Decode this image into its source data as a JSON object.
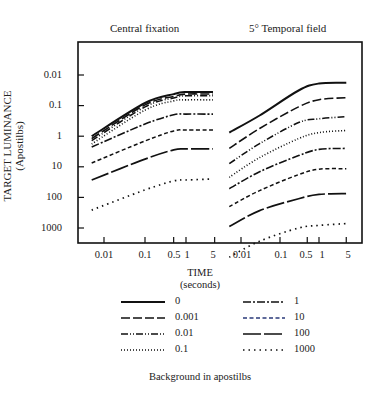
{
  "chart_data": {
    "type": "line",
    "title": "",
    "panels": [
      {
        "title": "Central fixation",
        "x": [
          0.005,
          0.1,
          0.5,
          1,
          5
        ],
        "series": [
          {
            "name": "0",
            "values": [
              1.0,
              0.082,
              0.042,
              0.036,
              0.036
            ]
          },
          {
            "name": "0.001",
            "values": [
              1.2,
              0.095,
              0.05,
              0.042,
              0.042
            ]
          },
          {
            "name": "0.01",
            "values": [
              1.4,
              0.11,
              0.056,
              0.048,
              0.048
            ]
          },
          {
            "name": "0.1",
            "values": [
              1.8,
              0.14,
              0.07,
              0.065,
              0.065
            ]
          },
          {
            "name": "1",
            "values": [
              2.25,
              0.4,
              0.2,
              0.19,
              0.19
            ]
          },
          {
            "name": "10",
            "values": [
              7.5,
              1.43,
              0.67,
              0.63,
              0.63
            ]
          },
          {
            "name": "100",
            "values": [
              27,
              5.6,
              2.8,
              2.6,
              2.6
            ]
          },
          {
            "name": "1000",
            "values": [
              260,
              57,
              29,
              27,
              25
            ]
          }
        ]
      },
      {
        "title": "5° Temporal field",
        "x": [
          0.005,
          0.03,
          0.3,
          1,
          5
        ],
        "series": [
          {
            "name": "0",
            "values": [
              0.76,
              0.21,
              0.032,
              0.019,
              0.018
            ]
          },
          {
            "name": "0.001",
            "values": [
              2.5,
              0.56,
              0.11,
              0.064,
              0.055
            ]
          },
          {
            "name": "0.01",
            "values": [
              7.9,
              1.75,
              0.36,
              0.27,
              0.23
            ]
          },
          {
            "name": "0.1",
            "values": [
              22,
              5.0,
              1.2,
              0.76,
              0.65
            ]
          },
          {
            "name": "1",
            "values": [
              52,
              14.5,
              4.3,
              2.7,
              2.5
            ]
          },
          {
            "name": "10",
            "values": [
              200,
              60,
              18,
              12,
              11.5
            ]
          },
          {
            "name": "100",
            "values": [
              900,
              270,
              110,
              80,
              75
            ]
          },
          {
            "name": "1000",
            "values": [
              9000,
              2700,
              1000,
              820,
              720
            ]
          }
        ]
      }
    ],
    "xlabel": "TIME (seconds)",
    "ylabel": "TARGET LUMINANCE (Apostilbs)",
    "x_ticks": [
      "0.01",
      "0.1",
      "0.5",
      "1",
      "5"
    ],
    "y_ticks": [
      "0.01",
      "0.1",
      "1",
      "10",
      "100",
      "1000"
    ],
    "y_scale": "log, inverted (0.01 at top, 1000 at bottom)",
    "x_scale": "log",
    "legend_title": "Background in apostilbs",
    "legend_position": "bottom",
    "grid": false
  },
  "titles": {
    "left": "Central fixation",
    "right": "5° Temporal field"
  },
  "axes": {
    "ylabel_line1": "TARGET LUMINANCE",
    "ylabel_line2": "(Apostilbs)",
    "xlabel_line1": "TIME",
    "xlabel_line2": "(seconds)",
    "yticks": [
      "0.01",
      "0.1",
      "1",
      "10",
      "100",
      "1000"
    ],
    "xticks_left": [
      "0.01",
      "0.1",
      "0.5",
      "1",
      "5"
    ],
    "xticks_right": [
      "0.01",
      "0.1",
      "0.5",
      "1",
      "5"
    ]
  },
  "legend": {
    "title": "Background in apostilbs",
    "items": [
      {
        "label": "0",
        "style": "solid"
      },
      {
        "label": "0.001",
        "style": "dashed"
      },
      {
        "label": "0.01",
        "style": "dash-dot-dot"
      },
      {
        "label": "0.1",
        "style": "dotted"
      },
      {
        "label": "1",
        "style": "dash-dot"
      },
      {
        "label": "10",
        "style": "short-dash"
      },
      {
        "label": "100",
        "style": "long-dash"
      },
      {
        "label": "1000",
        "style": "sparse-dots"
      }
    ]
  }
}
